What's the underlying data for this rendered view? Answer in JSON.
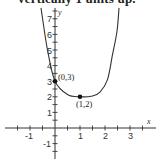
{
  "caption": "vertically 1 units up.",
  "chart_data": {
    "type": "line",
    "title": "",
    "xlabel": "x",
    "ylabel": "y",
    "xlim": [
      -2,
      4
    ],
    "ylim": [
      -2,
      8
    ],
    "grid": false,
    "x_tick_labels": [
      "-1",
      "1",
      "2",
      "3"
    ],
    "y_tick_labels": [
      "7",
      "6",
      "5",
      "4",
      "3",
      "2",
      "1",
      "-1"
    ],
    "labeled_points": [
      {
        "label": "(0,3)",
        "x": 0,
        "y": 3
      },
      {
        "label": "(1,2)",
        "x": 1,
        "y": 2
      }
    ],
    "series": [
      {
        "name": "curve",
        "note": "Only (0,3) and (1,2) are labeled in the image; other points are approximate positions read from pixels.",
        "points": [
          {
            "x": -0.56,
            "y": 7.7,
            "approx": true
          },
          {
            "x": -0.3,
            "y": 5.0,
            "approx": true
          },
          {
            "x": 0,
            "y": 3,
            "approx": false
          },
          {
            "x": 0.5,
            "y": 2.15,
            "approx": true
          },
          {
            "x": 1,
            "y": 2,
            "approx": false
          },
          {
            "x": 1.5,
            "y": 2.05,
            "approx": true
          },
          {
            "x": 1.8,
            "y": 2.3,
            "approx": true
          },
          {
            "x": 2.1,
            "y": 3.1,
            "approx": true
          },
          {
            "x": 2.3,
            "y": 4.7,
            "approx": true
          },
          {
            "x": 2.48,
            "y": 6.2,
            "approx": true
          },
          {
            "x": 2.56,
            "y": 7.7,
            "approx": true
          }
        ]
      }
    ]
  }
}
